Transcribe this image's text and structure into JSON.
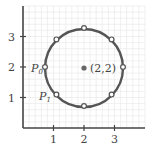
{
  "diagram": {
    "type": "circle-on-grid",
    "axes": {
      "x_ticks": [
        "1",
        "2",
        "3"
      ],
      "y_ticks": [
        "1",
        "2",
        "3"
      ],
      "range": [
        0,
        4
      ],
      "grid": true,
      "grid_step": 0.2
    },
    "circle": {
      "center": [
        2,
        2
      ],
      "center_label": "(2,2)",
      "radius": 1.28,
      "stroke_color": "#555555",
      "points_count": 8
    },
    "labels": {
      "p0": {
        "main": "P",
        "sub": "0"
      },
      "p1": {
        "main": "P",
        "sub": "1"
      }
    },
    "colors": {
      "axis": "#444444",
      "grid": "#e6e6e6",
      "circle": "#555555",
      "point_fill": "#ffffff",
      "center_fill": "#666666"
    }
  }
}
